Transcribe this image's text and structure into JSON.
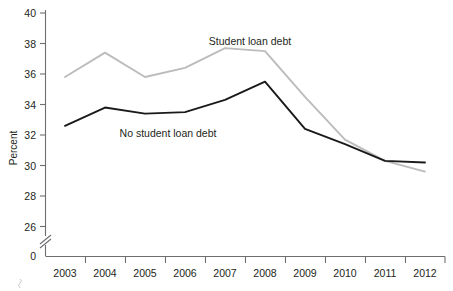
{
  "chart_data": {
    "type": "line",
    "title": "",
    "xlabel": "",
    "ylabel": "Percent",
    "categories": [
      "2003",
      "2004",
      "2005",
      "2006",
      "2007",
      "2008",
      "2009",
      "2010",
      "2011",
      "2012"
    ],
    "x": [
      2003,
      2004,
      2005,
      2006,
      2007,
      2008,
      2009,
      2010,
      2011,
      2012
    ],
    "ylim": [
      26,
      40
    ],
    "yticks": [
      26,
      28,
      30,
      32,
      34,
      36,
      38,
      40
    ],
    "ytick_labels": [
      "26",
      "28",
      "30",
      "32",
      "34",
      "36",
      "38",
      "40"
    ],
    "zero_tick_label": "0",
    "axis_break": true,
    "grid": false,
    "legend_position": "inline-annotations",
    "series": [
      {
        "name": "Student loan debt",
        "color": "#bcbcbc",
        "values": [
          35.8,
          37.4,
          35.8,
          36.4,
          37.7,
          37.5,
          34.5,
          31.7,
          30.3,
          29.6
        ]
      },
      {
        "name": "No student loan debt",
        "color": "#1a1a1a",
        "values": [
          32.6,
          33.8,
          33.4,
          33.5,
          34.3,
          35.5,
          32.4,
          31.4,
          30.3,
          30.2
        ]
      }
    ],
    "annotations": [
      {
        "text": "Student loan debt",
        "series": "Student loan debt"
      },
      {
        "text": "No student loan debt",
        "series": "No student loan debt"
      }
    ]
  },
  "axis": {
    "y_label": "Percent",
    "y_ticks": [
      "40",
      "38",
      "36",
      "34",
      "32",
      "30",
      "28",
      "26"
    ],
    "y_zero": "0",
    "x_ticks": [
      "2003",
      "2004",
      "2005",
      "2006",
      "2007",
      "2008",
      "2009",
      "2010",
      "2011",
      "2012"
    ]
  },
  "labels": {
    "student_loan_debt": "Student loan debt",
    "no_student_loan_debt": "No student loan debt"
  }
}
